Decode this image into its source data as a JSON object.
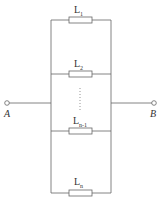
{
  "diagram": {
    "type": "parallel-circuit",
    "terminals": {
      "left": "A",
      "right": "B"
    },
    "branches": [
      {
        "label": "L",
        "sub": "1"
      },
      {
        "label": "L",
        "sub": "2"
      },
      {
        "label": "L",
        "sub": "n-1"
      },
      {
        "label": "L",
        "sub": "n"
      }
    ],
    "ellipsis": "⋮",
    "colors": {
      "wire": "#555555",
      "text": "#333333"
    }
  }
}
